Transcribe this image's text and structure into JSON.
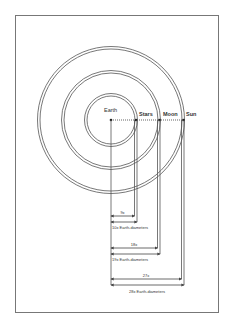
{
  "diagram": {
    "center_label": "Earth",
    "ring_labels": [
      "Stars",
      "Moon",
      "Sun"
    ],
    "measurements": [
      {
        "inner": "9x",
        "outer": "10x Earth-diameters"
      },
      {
        "inner": "18x",
        "outer": "19x Earth-diameters"
      },
      {
        "inner": "27x",
        "outer": "28x Earth-diameters"
      }
    ]
  },
  "colors": {
    "line": "#555555",
    "frame": "#777777",
    "background": "#ffffff"
  }
}
